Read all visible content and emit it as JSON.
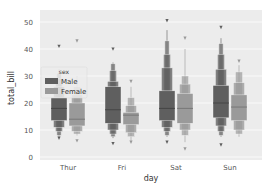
{
  "chart_data": {
    "type": "boxen",
    "title": "",
    "xlabel": "day",
    "ylabel": "total_bill",
    "categories": [
      "Thur",
      "Fri",
      "Sat",
      "Sun"
    ],
    "yticks": [
      0,
      10,
      20,
      30,
      40,
      50
    ],
    "ylim": [
      -2,
      55
    ],
    "grid": true,
    "legend": {
      "title": "sex",
      "position": "center-left",
      "entries": [
        {
          "label": "Male",
          "color": "#5f5f5f"
        },
        {
          "label": "Female",
          "color": "#9a9a9a"
        }
      ]
    },
    "series": [
      {
        "name": "Male",
        "color": "#5f5f5f",
        "boxes": [
          {
            "day": "Thur",
            "median": 18.0,
            "levels": [
              [
                13.5,
                22.0
              ],
              [
                11.0,
                26.0
              ],
              [
                9.5,
                29.0
              ],
              [
                8.0,
                31.0
              ]
            ],
            "min": 7.5,
            "max": 32.5,
            "outliers": [
              41.0,
              7.0
            ]
          },
          {
            "day": "Fri",
            "median": 17.5,
            "levels": [
              [
                12.5,
                26.0
              ],
              [
                10.0,
                28.0
              ],
              [
                8.5,
                32.0
              ],
              [
                7.5,
                34.5
              ]
            ],
            "min": 7.0,
            "max": 35.0,
            "outliers": [
              40.0,
              5.0
            ]
          },
          {
            "day": "Sat",
            "median": 18.0,
            "levels": [
              [
                13.5,
                24.5
              ],
              [
                11.0,
                33.0
              ],
              [
                9.5,
                38.0
              ],
              [
                8.0,
                43.0
              ]
            ],
            "min": 7.5,
            "max": 47.0,
            "outliers": [
              50.5,
              5.5
            ]
          },
          {
            "day": "Sun",
            "median": 20.0,
            "levels": [
              [
                14.5,
                26.5
              ],
              [
                11.5,
                32.5
              ],
              [
                9.5,
                38.0
              ],
              [
                8.0,
                42.0
              ]
            ],
            "min": 7.5,
            "max": 44.0,
            "outliers": [
              48.0,
              4.5
            ]
          }
        ]
      },
      {
        "name": "Female",
        "color": "#9a9a9a",
        "boxes": [
          {
            "day": "Thur",
            "median": 14.0,
            "levels": [
              [
                11.5,
                20.0
              ],
              [
                9.5,
                23.0
              ],
              [
                8.5,
                26.0
              ]
            ],
            "min": 8.0,
            "max": 30.0,
            "outliers": [
              43.0,
              6.0
            ]
          },
          {
            "day": "Fri",
            "median": 15.5,
            "levels": [
              [
                12.0,
                16.5
              ],
              [
                9.0,
                19.0
              ],
              [
                7.5,
                22.0
              ]
            ],
            "min": 6.0,
            "max": 26.0,
            "outliers": [
              28.0,
              5.5
            ]
          },
          {
            "day": "Sat",
            "median": 18.0,
            "levels": [
              [
                12.5,
                23.5
              ],
              [
                10.0,
                27.0
              ],
              [
                8.0,
                30.0
              ]
            ],
            "min": 5.5,
            "max": 40.0,
            "outliers": [
              44.0,
              3.0
            ]
          },
          {
            "day": "Sun",
            "median": 18.5,
            "levels": [
              [
                13.5,
                23.0
              ],
              [
                10.0,
                27.5
              ],
              [
                8.5,
                31.5
              ]
            ],
            "min": 7.5,
            "max": 34.0,
            "outliers": [
              35.5
            ]
          }
        ]
      }
    ]
  }
}
